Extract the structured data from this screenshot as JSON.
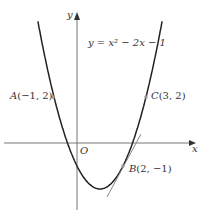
{
  "diagram": {
    "equation_label": "y = x² − 2x − 1",
    "axis_x_label": "x",
    "axis_y_label": "y",
    "origin_label": "O",
    "points": [
      {
        "name": "A",
        "coords": "(−1, 2)"
      },
      {
        "name": "B",
        "coords": "(2, −1)"
      },
      {
        "name": "C",
        "coords": "(3, 2)"
      }
    ],
    "colors": {
      "curve": "#222222",
      "tangent": "#888888",
      "axes": "#777777"
    }
  }
}
